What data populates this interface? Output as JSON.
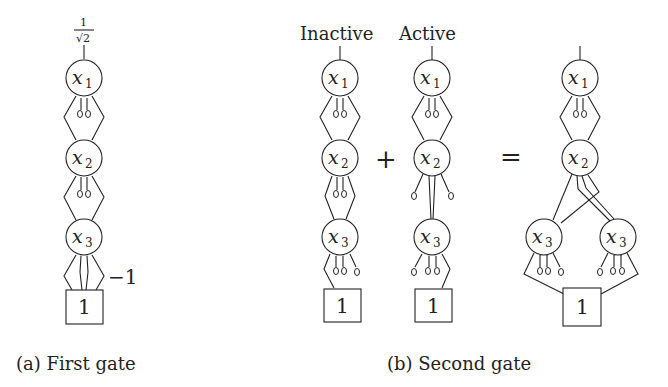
{
  "figure": {
    "panel_a": {
      "caption": "(a) First gate",
      "root_weight_num": "1",
      "root_weight_den": "√2",
      "nodes": [
        {
          "var": "x",
          "sub": "1"
        },
        {
          "var": "x",
          "sub": "2"
        },
        {
          "var": "x",
          "sub": "3"
        }
      ],
      "terminal": "1",
      "edge_weight": "−1"
    },
    "panel_b": {
      "caption": "(b) Second gate",
      "inactive_label": "Inactive",
      "active_label": "Active",
      "plus": "+",
      "equals": "=",
      "inactive_nodes": [
        {
          "var": "x",
          "sub": "1"
        },
        {
          "var": "x",
          "sub": "2"
        },
        {
          "var": "x",
          "sub": "3"
        }
      ],
      "active_nodes": [
        {
          "var": "x",
          "sub": "1"
        },
        {
          "var": "x",
          "sub": "2"
        },
        {
          "var": "x",
          "sub": "3"
        }
      ],
      "result_nodes": [
        {
          "var": "x",
          "sub": "1"
        },
        {
          "var": "x",
          "sub": "2"
        },
        {
          "var": "x",
          "sub": "3"
        },
        {
          "var": "x",
          "sub": "3"
        }
      ],
      "terminal": "1"
    }
  }
}
